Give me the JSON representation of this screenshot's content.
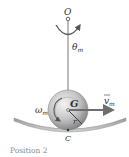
{
  "diagram": {
    "labels": {
      "pivot": "O",
      "angle": "θ",
      "angle_sub": "m",
      "center": "G",
      "contact": "C",
      "omega": "ω",
      "omega_sub": "m",
      "velocity": "v",
      "velocity_sub": "m",
      "radius": "r"
    },
    "caption": "Position 2",
    "colors": {
      "rod": "#7a7a7a",
      "surface": "#8c8c8c",
      "ball_light": "#e8e8e8",
      "ball_dark": "#8a8a8a",
      "arrow": "#6e6e6e",
      "text": "#333333",
      "caption": "#8a8a8a"
    }
  }
}
